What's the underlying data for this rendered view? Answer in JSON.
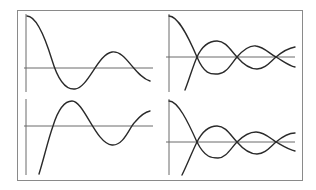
{
  "figure": {
    "colors": {
      "frame": "#8a8a8a",
      "axis": "#6a6a6a",
      "curve": "#2a2a2a",
      "background": "#ffffff"
    }
  },
  "panels": [
    {
      "id": "top-left",
      "kind": "damped cosine",
      "curves": 1
    },
    {
      "id": "top-right",
      "kind": "damped cosine and its negative pair",
      "curves": 2
    },
    {
      "id": "bottom-left",
      "kind": "damped sine (rising start)",
      "curves": 1
    },
    {
      "id": "bottom-right",
      "kind": "damped cosine and its negative pair",
      "curves": 2
    }
  ]
}
